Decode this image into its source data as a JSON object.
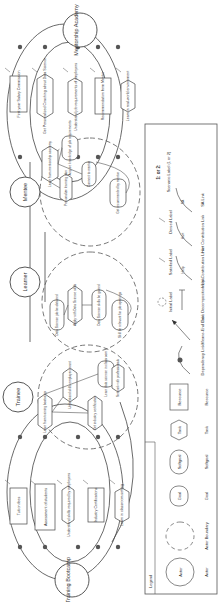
{
  "actors": {
    "training_bootcamp": "Training Bootcamp",
    "trainee": "Trainee",
    "learner": "Learner",
    "mentee": "Mentee",
    "mentorship_academy": "Mentorship Academy"
  },
  "bootcamp_elements": [
    "Tuition fees",
    "Assessment of students",
    "Understand skills required by employers",
    "Industry Certifications",
    "Learn in classroom setting"
  ],
  "academy_elements": [
    "First year Salary Commission",
    "Get Personalized Coaching about Data Science",
    "Understand job requirements of employers",
    "Recommendation from Mentor",
    "Learn in real-world environment"
  ],
  "trainee_elements": [
    "Learn from training bootcamp",
    "Understand skills employers want",
    "Get industry certification",
    "Learn data science in classroom",
    "Network with professionals"
  ],
  "learner_elements": [
    "Data Science job be obtained",
    "Apply with Data Science skills",
    "Data Science skills be gained",
    "Skill be relevant for job openings"
  ],
  "mentee_elements": [
    "Learn from mentorship academy",
    "Acquire knowledge of job requirements",
    "Connect to mentor",
    "Personalize learning plan",
    "Get recommended by mentor"
  ],
  "legend": {
    "title": "Legend",
    "items": [
      {
        "symbol": "Actor",
        "caption": "Actor"
      },
      {
        "symbol": "",
        "caption": "Actor Boundary"
      },
      {
        "symbol": "Goal",
        "caption": "Goal"
      },
      {
        "symbol": "Softgoal",
        "caption": "Softgoal"
      },
      {
        "symbol": "Task",
        "caption": "Task"
      },
      {
        "symbol": "Resource",
        "caption": "Resource"
      },
      {
        "symbol": "D",
        "caption": "Dependency Link"
      },
      {
        "symbol": "",
        "caption": "Means-End Link"
      },
      {
        "symbol": "",
        "caption": "Task Decomposition Link"
      },
      {
        "symbol": "Help",
        "caption": "Help Contribution Link"
      },
      {
        "symbol": "Hurt",
        "caption": "Hurt Contribution Link"
      },
      {
        "symbol": "SA",
        "caption": "SA Link"
      },
      {
        "symbol": "",
        "caption": "Initial Label"
      },
      {
        "symbol": "",
        "caption": "Satisfied Label"
      },
      {
        "symbol": "",
        "caption": "Denied Label"
      },
      {
        "symbol": "1: or 2:",
        "caption": "Scenario Label (1 or 2)"
      }
    ]
  },
  "link_labels": {
    "help": "Help",
    "hurt": "Hurt",
    "sa": "SA",
    "dependency": "D"
  }
}
